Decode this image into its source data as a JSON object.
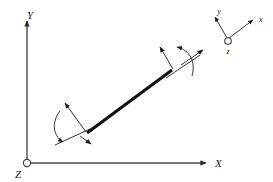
{
  "figure": {
    "background_color": "#ffffff",
    "ink_color": "#111111",
    "axis_color": "#4a4a4a",
    "global_frame": {
      "name": "global-coordinate-frame",
      "origin_marker": "open-circle",
      "labels": {
        "x": "X",
        "y": "Y",
        "z": "Z"
      }
    },
    "local_frame": {
      "name": "local-coordinate-frame",
      "origin_marker": "open-circle",
      "labels": {
        "x": "x",
        "y": "y",
        "z": "z"
      }
    },
    "link": {
      "name": "rigid-link",
      "style": "thick-solid-line"
    },
    "end_markers": [
      {
        "id": "lower-left-end",
        "arrows": [
          "translation-arrow-upper-left",
          "translation-arrow-lower-right"
        ],
        "arcs": [
          "rotation-arc-ccw"
        ]
      },
      {
        "id": "upper-right-end",
        "arrows": [
          "translation-arrow-upper-left",
          "translation-arrow-upper-right"
        ],
        "arcs": [
          "rotation-arc-ccw"
        ]
      }
    ]
  }
}
